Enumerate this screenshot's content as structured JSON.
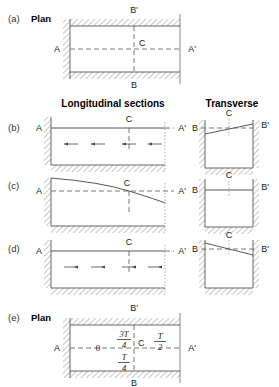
{
  "figure": {
    "width": 279,
    "height": 387,
    "background": "#ffffff",
    "line_color": "#444444",
    "hatch_color": "#9a9a9a"
  },
  "column_headers": {
    "longitudinal": "Longitudinal sections",
    "transverse": "Transverse"
  },
  "panels": [
    {
      "id": "a",
      "letter": "(a)",
      "title": "Plan",
      "labels": {
        "left": "A",
        "right": "A'",
        "top": "B'",
        "bottom": "B",
        "center": "C"
      }
    },
    {
      "id": "b",
      "letter": "(b)",
      "title": "",
      "longitudinal": {
        "labels": {
          "left": "A",
          "right": "A'",
          "center": "C"
        },
        "surface": "flat",
        "flow_direction": "left",
        "arrow_count": 4
      },
      "transverse": {
        "labels": {
          "left": "B",
          "right": "B'",
          "center": "C"
        },
        "surface": "tilted-up-right"
      }
    },
    {
      "id": "c",
      "letter": "(c)",
      "title": "",
      "longitudinal": {
        "labels": {
          "left": "A",
          "right": "A'",
          "center": "C"
        },
        "surface": "curved-down-right",
        "flow_direction": "none",
        "arrow_count": 0
      },
      "transverse": {
        "labels": {
          "left": "B",
          "right": "B'",
          "center": "C"
        },
        "surface": "flat"
      }
    },
    {
      "id": "d",
      "letter": "(d)",
      "title": "",
      "longitudinal": {
        "labels": {
          "left": "A",
          "right": "A'",
          "center": "C"
        },
        "surface": "flat",
        "flow_direction": "right",
        "arrow_count": 4
      },
      "transverse": {
        "labels": {
          "left": "B",
          "right": "B'",
          "center": "C"
        },
        "surface": "tilted-down-right"
      }
    },
    {
      "id": "e",
      "letter": "(e)",
      "title": "Plan",
      "labels": {
        "left": "A",
        "right": "A'",
        "top": "B'",
        "bottom": "B",
        "center": "C"
      },
      "phase_labels": {
        "origin": "0",
        "upper": {
          "numerator": "3T",
          "denominator": "4"
        },
        "right": {
          "numerator": "T",
          "denominator": "2"
        },
        "lower": {
          "numerator": "T",
          "denominator": "4"
        }
      }
    }
  ]
}
